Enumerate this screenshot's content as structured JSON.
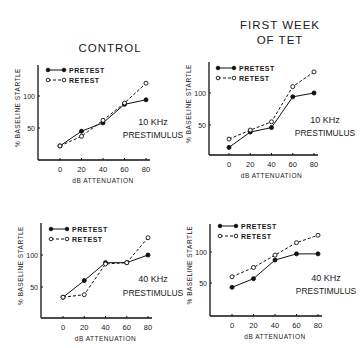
{
  "column_titles": [
    "CONTROL",
    "FIRST WEEK",
    "OF TET"
  ],
  "chart_data": [
    {
      "type": "line",
      "group": "CONTROL",
      "annotation": [
        "10 KHz",
        "PRESTIMULUS"
      ],
      "xlabel": "dB ATTENUATION",
      "ylabel": "% BASELINE STARTLE",
      "x": [
        0,
        20,
        40,
        60,
        80
      ],
      "xticks": [
        "0",
        "20",
        "40",
        "60",
        "80"
      ],
      "yticks": [
        "50",
        "100"
      ],
      "ylim": [
        0,
        140
      ],
      "legend_position": "top-left",
      "series": [
        {
          "name": "PRETEST",
          "style": "solid-filled",
          "values": [
            22,
            45,
            58,
            87,
            94
          ]
        },
        {
          "name": "RETEST",
          "style": "dashed-open",
          "values": [
            22,
            37,
            62,
            89,
            120
          ]
        }
      ]
    },
    {
      "type": "line",
      "group": "FIRST WEEK OF TET",
      "annotation": [
        "10 KHz",
        "PRESTIMULUS"
      ],
      "xlabel": "dB ATTENUATION",
      "ylabel": "% BASELINE STARTLE",
      "x": [
        0,
        20,
        40,
        60,
        80
      ],
      "xticks": [
        "0",
        "20",
        "40",
        "60",
        "80"
      ],
      "yticks": [
        "50",
        "100"
      ],
      "ylim": [
        0,
        140
      ],
      "legend_position": "top-left",
      "series": [
        {
          "name": "PRETEST",
          "style": "solid-filled",
          "values": [
            15,
            39,
            46,
            94,
            100
          ]
        },
        {
          "name": "RETEST",
          "style": "dashed-open",
          "values": [
            28,
            42,
            55,
            110,
            133
          ]
        }
      ]
    },
    {
      "type": "line",
      "group": "CONTROL",
      "annotation": [
        "40 KHz",
        "PRESTIMULUS"
      ],
      "xlabel": "dB ATTENUATION",
      "ylabel": "% BASELINE STARTLE",
      "x": [
        0,
        20,
        40,
        60,
        80
      ],
      "xticks": [
        "0",
        "20",
        "40",
        "60",
        "80"
      ],
      "yticks": [
        "50",
        "100"
      ],
      "ylim": [
        0,
        140
      ],
      "legend_position": "top-left",
      "series": [
        {
          "name": "PRETEST",
          "style": "solid-filled",
          "values": [
            34,
            60,
            88,
            88,
            100
          ]
        },
        {
          "name": "RETEST",
          "style": "dashed-open",
          "values": [
            34,
            38,
            86,
            88,
            127
          ]
        }
      ]
    },
    {
      "type": "line",
      "group": "FIRST WEEK OF TET",
      "annotation": [
        "40 KHz",
        "PRESTIMULUS"
      ],
      "xlabel": "dB ATTENUATION",
      "ylabel": "% BASELINE STARTLE",
      "x": [
        0,
        20,
        40,
        60,
        80
      ],
      "xticks": [
        "0",
        "20",
        "40",
        "60",
        "80"
      ],
      "yticks": [
        "50",
        "100"
      ],
      "ylim": [
        0,
        140
      ],
      "legend_position": "top-left",
      "series": [
        {
          "name": "PRETEST",
          "style": "solid-filled",
          "values": [
            43,
            57,
            87,
            97,
            97
          ]
        },
        {
          "name": "RETEST",
          "style": "dashed-open",
          "values": [
            60,
            75,
            95,
            115,
            127
          ]
        }
      ]
    }
  ]
}
